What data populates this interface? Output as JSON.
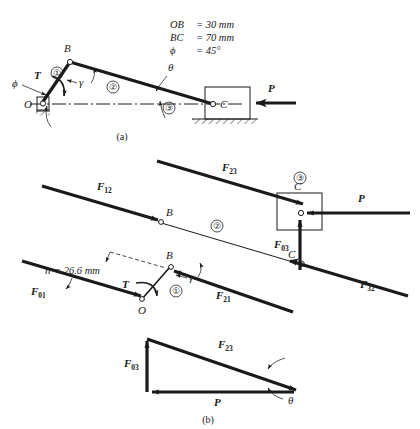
{
  "figure": {
    "captions": {
      "a": "(a)",
      "b": "(b)"
    },
    "colors": {
      "ink": "#1a1a1a",
      "background": "#ffffff"
    }
  },
  "parameters": {
    "line1": "OB = 30 mm",
    "line2": "BC = 70 mm",
    "line3_symbol": "ϕ",
    "line3_value": "= 45°",
    "ob_label": "OB",
    "ob_value": "= 30 mm",
    "bc_label": "BC",
    "bc_value": "= 70 mm"
  },
  "part_a": {
    "points": {
      "O": "O",
      "B": "B",
      "C": "C"
    },
    "links": {
      "one": "①",
      "two": "②",
      "three": "③"
    },
    "angles": {
      "phi": "ϕ",
      "gamma": "γ",
      "theta": "θ"
    },
    "forces": {
      "torque": "T",
      "applied": "P"
    }
  },
  "part_b": {
    "link2_fbd": {
      "force_at_b": "F",
      "force_at_b_sub": "12",
      "force_at_c": "F",
      "force_at_c_sub": "23",
      "link_label": "②",
      "point_b": "B",
      "point_c": "C"
    },
    "link1_fbd": {
      "pin_force": "F",
      "pin_force_sub": "01",
      "coupler_force": "F",
      "coupler_force_sub": "21",
      "torque": "T",
      "angle": "γ",
      "link_label": "①",
      "point_o": "O",
      "point_b": "B",
      "moment_arm": "h = 26.6 mm",
      "moment_arm_symbol": "h",
      "moment_arm_value": "= 26.6 mm"
    },
    "link3_fbd": {
      "link_label": "③",
      "point_c": "C",
      "applied": "P",
      "normal_force": "F",
      "normal_force_sub": "03",
      "coupler_force": "F",
      "coupler_force_sub": "32"
    },
    "force_triangle": {
      "vertical": "F",
      "vertical_sub": "03",
      "hypotenuse": "F",
      "hypotenuse_sub": "23",
      "horizontal": "P",
      "angle": "θ"
    }
  }
}
